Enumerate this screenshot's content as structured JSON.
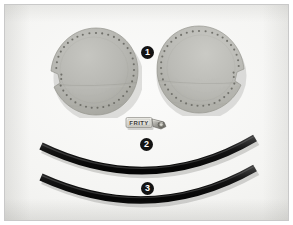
{
  "figure": {
    "name": "product-parts-photo",
    "background_color": "#f2f2f0",
    "frame_color": "#c9c9c9",
    "width": 293,
    "height": 225
  },
  "callouts": [
    {
      "number": "1",
      "label": "ear-pad-discs",
      "description": "Pair of round grey perforated ear pad discs with stitch holes around the rim",
      "color": "#131313",
      "text_color": "#ffffff"
    },
    {
      "number": "2",
      "label": "zipper-pull-tag",
      "description": "Small light fabric zipper pull tag with metal slider",
      "color": "#131313",
      "text_color": "#ffffff"
    },
    {
      "number": "3",
      "label": "elastic-strips",
      "description": "Two curved black elastic head strap strips",
      "color": "#131313",
      "text_color": "#ffffff"
    }
  ],
  "parts": {
    "pad_left": {
      "name": "ear-pad-left",
      "fill": "#b9b9b4",
      "fill_shade": "#a9a9a3",
      "edge": "#9a9a93",
      "hole_color": "#6f6f69",
      "hole_count": 46
    },
    "pad_right": {
      "name": "ear-pad-right",
      "fill": "#bdbdb8",
      "fill_shade": "#adada6",
      "edge": "#9e9e97",
      "hole_color": "#72726c",
      "hole_count": 46
    },
    "zipper_tag": {
      "name": "zipper-pull-tag",
      "brand_text": "FRITY",
      "tag_fill": "#e3e2dd",
      "tag_edge": "#8e8d87",
      "text_color": "#3b3a36",
      "metal_fill": "#9b9a94",
      "metal_highlight": "#d8d7d1"
    },
    "strip_top": {
      "name": "elastic-strip-top",
      "color": "#111111",
      "highlight": "#3a3a3a",
      "thickness": 7
    },
    "strip_bottom": {
      "name": "elastic-strip-bottom",
      "color": "#0e0e0e",
      "highlight": "#383838",
      "thickness": 7
    }
  }
}
